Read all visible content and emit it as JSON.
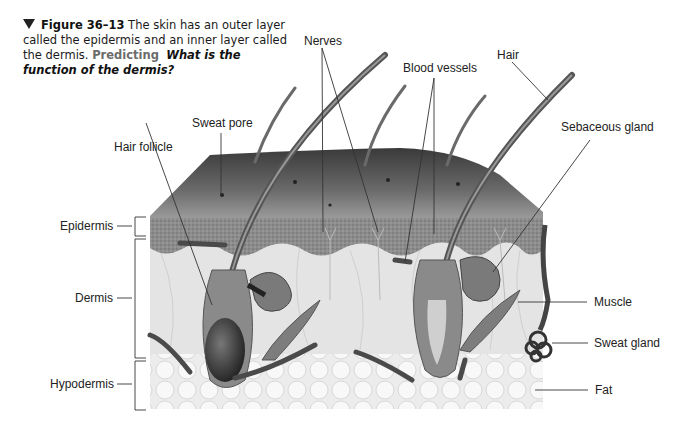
{
  "caption": {
    "marker_icon": "down-triangle",
    "figure_label": "Figure 36–13",
    "text": " The skin has an outer layer called the epidermis and an inner layer called the dermis. ",
    "predicting": "Predicting",
    "question": "What is the function of the dermis?"
  },
  "labels": {
    "nerves": "Nerves",
    "hair": "Hair",
    "blood_vessels": "Blood vessels",
    "sweat_pore": "Sweat pore",
    "hair_follicle": "Hair follicle",
    "sebaceous_gland": "Sebaceous gland",
    "epidermis": "Epidermis",
    "dermis": "Dermis",
    "hypodermis": "Hypodermis",
    "muscle": "Muscle",
    "sweat_gland": "Sweat gland",
    "fat": "Fat"
  },
  "colors": {
    "surface": "#4a4a4a",
    "epidermis": "#8a8a8a",
    "dermis": "#e6e6e6",
    "hypodermis": "#f0f0f0",
    "leader_line": "#333333"
  }
}
